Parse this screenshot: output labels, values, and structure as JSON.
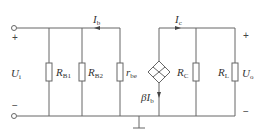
{
  "diagram": {
    "type": "small-signal equivalent circuit",
    "input": {
      "symbol": "U",
      "sub": "i",
      "plus": "+",
      "minus": "−"
    },
    "output": {
      "symbol": "U",
      "sub": "o",
      "plus": "+",
      "minus": "−"
    },
    "components": [
      {
        "id": "RB1",
        "symbol": "R",
        "sub": "B1"
      },
      {
        "id": "RB2",
        "symbol": "R",
        "sub": "B2"
      },
      {
        "id": "rbe",
        "symbol": "r",
        "sub": "be"
      },
      {
        "id": "source",
        "symbol": "βI",
        "sub": "b"
      },
      {
        "id": "RC",
        "symbol": "R",
        "sub": "C"
      },
      {
        "id": "RL",
        "symbol": "R",
        "sub": "L"
      }
    ],
    "currents": [
      {
        "id": "Ib",
        "symbol": "I",
        "sub": "b"
      },
      {
        "id": "Ic",
        "symbol": "I",
        "sub": "c"
      }
    ],
    "colors": {
      "wire": "#666666",
      "text": "#333333"
    }
  }
}
